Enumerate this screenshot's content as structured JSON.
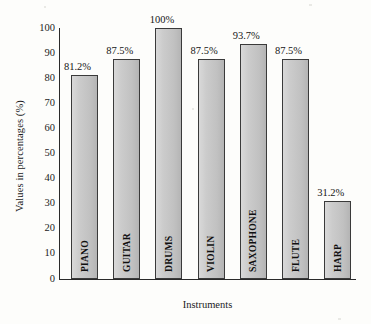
{
  "chart_data": {
    "type": "bar",
    "title": "",
    "xlabel": "Instruments",
    "ylabel": "Values in percentages (%)",
    "categories": [
      "PIANO",
      "GUITAR",
      "DRUMS",
      "VIOLIN",
      "SAXOPHONE",
      "FLUTE",
      "HARP"
    ],
    "values": [
      81.2,
      87.5,
      100,
      87.5,
      93.7,
      87.5,
      31.2
    ],
    "data_labels": [
      "81.2%",
      "87.5%",
      "100%",
      "87.5%",
      "93.7%",
      "87.5%",
      "31.2%"
    ],
    "ylim": [
      0,
      100
    ],
    "ytick_labels": [
      "0",
      "10",
      "20",
      "30",
      "40",
      "50",
      "60",
      "70",
      "80",
      "90",
      "100"
    ],
    "ytick_values": [
      0,
      10,
      20,
      30,
      40,
      50,
      60,
      70,
      80,
      90,
      100
    ],
    "grid": false,
    "legend": "none",
    "bar_color": "#c9c9c9",
    "bar_edge_color": "#3a3a3a",
    "background_color": "#fdfdfb",
    "text_color": "#1b1b1b"
  }
}
